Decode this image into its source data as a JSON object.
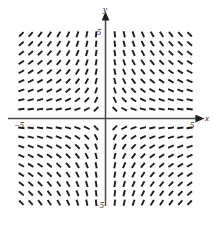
{
  "figure": {
    "kind": "slope-field",
    "background_color": "#ffffff",
    "stroke_color": "#1f1f1f"
  },
  "axes": {
    "x_axis": {
      "name": "x-axis",
      "label": "x",
      "label_x": 205,
      "label_y": 121,
      "y_pixel": 118.5,
      "x_start": 8,
      "x_end": 196,
      "arrow": "right",
      "ticks": [
        {
          "label": "−5",
          "value": -5,
          "x": 14,
          "y": 128
        },
        {
          "label": "5",
          "value": 5,
          "x": 190,
          "y": 128
        }
      ]
    },
    "y_axis": {
      "name": "y-axis",
      "label": "y",
      "label_x": 103,
      "label_y": 12,
      "x_pixel": 105.5,
      "y_start": 206,
      "y_end": 20,
      "arrow": "up",
      "ticks": [
        {
          "label": "5",
          "value": 5,
          "x": 97,
          "y": 35
        },
        {
          "label": "−5",
          "value": -5,
          "x": 94,
          "y": 208
        }
      ]
    }
  },
  "chart_data": {
    "type": "scatter",
    "title": "",
    "subtitle": "",
    "xlabel": "x",
    "ylabel": "y",
    "xlim": [
      -5.6,
      5.6
    ],
    "ylim": [
      -5.6,
      5.6
    ],
    "grid": false,
    "legend": null,
    "annotations": [],
    "xtick_labels": [
      "−5",
      "5"
    ],
    "ytick_labels": [
      "5",
      "−5"
    ],
    "field": {
      "equation": "dy/dx = -y/x",
      "description": "Direction field of short line segments; slope at each lattice point equals -y/x, giving hyperbolic solution curves xy = C.",
      "segment_length_px": 6.2,
      "segment_width_px": 1.9,
      "grid_origin_px": {
        "x": 105.5,
        "y": 118.5
      },
      "grid_spacing_px": {
        "x": 9.35,
        "y": 9.35
      },
      "grid_columns": 19,
      "grid_rows": 19,
      "x_values": [
        -4.5,
        -4.0,
        -3.5,
        -3.0,
        -2.5,
        -2.0,
        -1.5,
        -1.0,
        -0.5,
        0.5,
        1.0,
        1.5,
        2.0,
        2.5,
        3.0,
        3.5,
        4.0,
        4.5
      ],
      "y_values": [
        4.5,
        4.0,
        3.5,
        3.0,
        2.5,
        2.0,
        1.5,
        1.0,
        0.5,
        -0.5,
        -1.0,
        -1.5,
        -2.0,
        -2.5,
        -3.0,
        -3.5,
        -4.0,
        -4.5
      ],
      "quadrant_notes": [
        {
          "quadrant": "I",
          "slope_sign": "positive",
          "note": "near-vertical close to y-axis, flattening toward +x"
        },
        {
          "quadrant": "II",
          "slope_sign": "negative",
          "note": "near-vertical close to y-axis, flattening toward -x"
        },
        {
          "quadrant": "III",
          "slope_sign": "positive",
          "note": "near-horizontal close to x-axis, steepening toward y-axis"
        },
        {
          "quadrant": "IV",
          "slope_sign": "negative",
          "note": "near-horizontal close to x-axis, steepening toward y-axis"
        }
      ]
    }
  }
}
